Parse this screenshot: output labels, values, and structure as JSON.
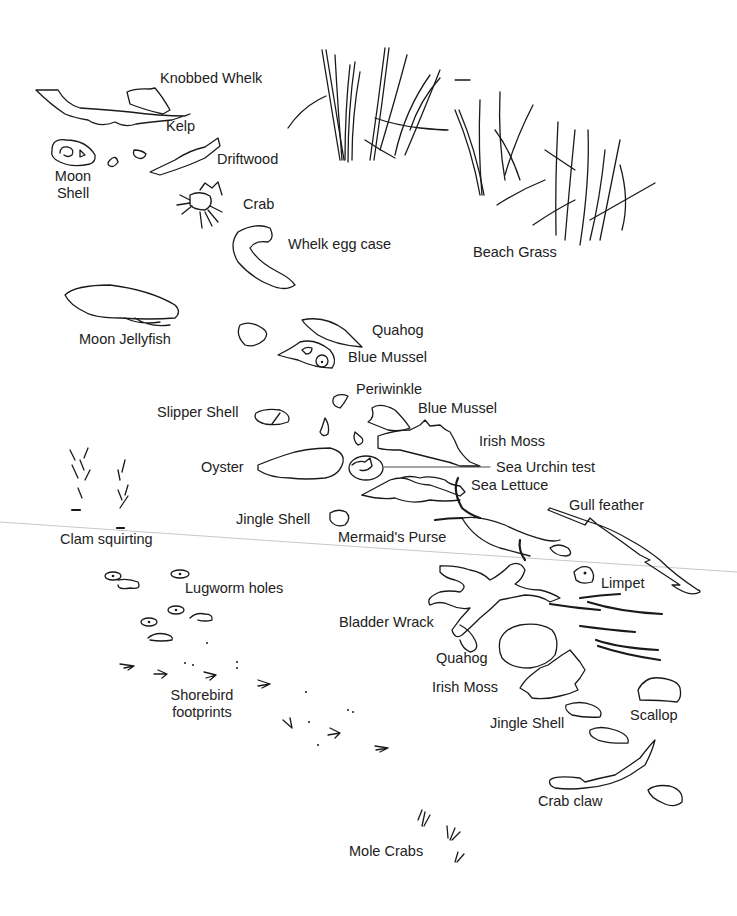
{
  "illustration": {
    "subject": "Beach and tidal flat finds",
    "labels": {
      "knobbed_whelk": "Knobbed Whelk",
      "kelp": "Kelp",
      "moon_shell": "Moon Shell",
      "driftwood": "Driftwood",
      "crab": "Crab",
      "whelk_egg_case": "Whelk egg case",
      "beach_grass": "Beach Grass",
      "moon_jellyfish": "Moon Jellyfish",
      "quahog_top": "Quahog",
      "blue_mussel_top": "Blue Mussel",
      "periwinkle": "Periwinkle",
      "slipper_shell": "Slipper Shell",
      "blue_mussel_mid": "Blue Mussel",
      "irish_moss_mid": "Irish Moss",
      "oyster": "Oyster",
      "sea_urchin_test": "Sea Urchin test",
      "sea_lettuce": "Sea Lettuce",
      "gull_feather": "Gull feather",
      "jingle_shell_mid": "Jingle Shell",
      "clam_squirting": "Clam squirting",
      "mermaids_purse": "Mermaid's Purse",
      "limpet": "Limpet",
      "lugworm_holes": "Lugworm holes",
      "bladder_wrack": "Bladder Wrack",
      "quahog_bottom": "Quahog",
      "irish_moss_bottom": "Irish Moss",
      "shorebird_footprints": "Shorebird footprints",
      "scallop": "Scallop",
      "jingle_shell_bottom": "Jingle Shell",
      "crab_claw": "Crab claw",
      "mole_crabs": "Mole Crabs"
    }
  }
}
